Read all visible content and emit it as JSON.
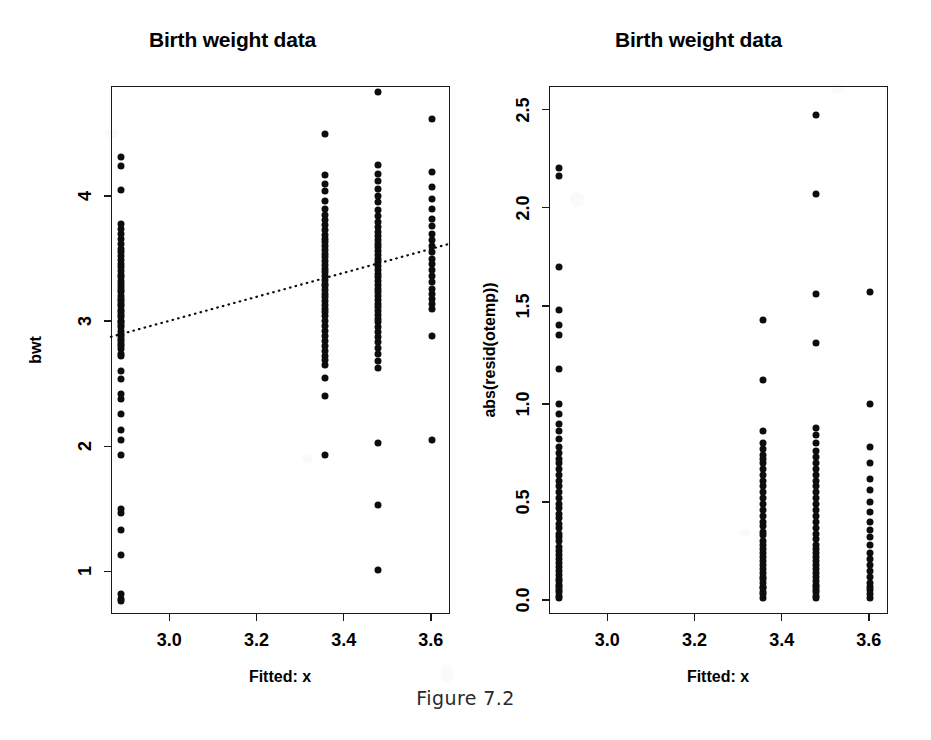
{
  "figure": {
    "caption": "Figure 7.2",
    "background_color": "#ffffff",
    "ink_color": "#0d0d0d"
  },
  "panels": [
    {
      "id": "left",
      "title": "Birth weight data",
      "xlabel": "Fitted: x",
      "ylabel": "bwt",
      "xticks": [
        "3.0",
        "3.2",
        "3.4",
        "3.6"
      ],
      "yticks": [
        "1",
        "2",
        "3",
        "4"
      ]
    },
    {
      "id": "right",
      "title": "Birth weight data",
      "xlabel": "Fitted: x",
      "ylabel": "abs(resid(otemp))",
      "xticks": [
        "3.0",
        "3.2",
        "3.4",
        "3.6"
      ],
      "yticks": [
        "0.0",
        "0.5",
        "1.0",
        "1.5",
        "2.0",
        "2.5"
      ]
    }
  ],
  "chart_data": [
    {
      "type": "scatter",
      "panel": "left",
      "title": "Birth weight data",
      "xlabel": "Fitted: x",
      "ylabel": "bwt",
      "xlim": [
        2.866,
        3.644
      ],
      "ylim": [
        0.66,
        4.88
      ],
      "xticks": [
        3.0,
        3.2,
        3.4,
        3.6
      ],
      "yticks": [
        1,
        2,
        3,
        4
      ],
      "grid": false,
      "legend": false,
      "annotations": [
        {
          "kind": "fitted-line",
          "style": "dotted",
          "x": [
            2.866,
            3.644
          ],
          "y": [
            2.875,
            3.62
          ]
        }
      ],
      "groups": [
        {
          "x": 2.889,
          "y": [
            0.76,
            0.78,
            0.82,
            1.13,
            1.33,
            1.47,
            1.5,
            1.93,
            2.05,
            2.13,
            2.26,
            2.38,
            2.42,
            2.54,
            2.6,
            2.72,
            2.74,
            2.78,
            2.8,
            2.82,
            2.84,
            2.86,
            2.88,
            2.9,
            2.92,
            2.95,
            2.97,
            2.99,
            3.0,
            3.03,
            3.05,
            3.07,
            3.09,
            3.12,
            3.14,
            3.16,
            3.18,
            3.2,
            3.23,
            3.25,
            3.27,
            3.3,
            3.32,
            3.35,
            3.37,
            3.4,
            3.43,
            3.46,
            3.49,
            3.52,
            3.55,
            3.58,
            3.62,
            3.66,
            3.7,
            3.74,
            3.78,
            4.05,
            4.24,
            4.31
          ]
        },
        {
          "x": 3.357,
          "y": [
            2.4,
            2.55,
            2.65,
            2.69,
            2.72,
            2.76,
            2.8,
            2.84,
            2.88,
            2.92,
            2.96,
            3.0,
            3.04,
            3.07,
            3.1,
            3.13,
            3.16,
            3.19,
            3.22,
            3.25,
            3.28,
            3.3,
            3.33,
            3.36,
            3.39,
            3.42,
            3.45,
            3.48,
            3.51,
            3.54,
            3.57,
            3.6,
            3.63,
            3.66,
            3.69,
            3.73,
            3.77,
            3.81,
            3.85,
            3.9,
            3.96,
            4.04,
            4.1,
            4.17,
            4.5,
            1.93
          ]
        },
        {
          "x": 3.478,
          "y": [
            1.01,
            1.53,
            2.03,
            2.63,
            2.68,
            2.74,
            2.79,
            2.83,
            2.87,
            2.91,
            2.95,
            2.99,
            3.02,
            3.05,
            3.08,
            3.11,
            3.14,
            3.17,
            3.2,
            3.23,
            3.26,
            3.29,
            3.32,
            3.35,
            3.38,
            3.41,
            3.44,
            3.47,
            3.5,
            3.53,
            3.56,
            3.59,
            3.62,
            3.65,
            3.68,
            3.71,
            3.75,
            3.79,
            3.84,
            3.89,
            3.95,
            4.0,
            4.06,
            4.12,
            4.18,
            4.25,
            4.83
          ]
        },
        {
          "x": 3.603,
          "y": [
            2.05,
            2.88,
            3.1,
            3.14,
            3.18,
            3.22,
            3.26,
            3.31,
            3.36,
            3.41,
            3.46,
            3.5,
            3.55,
            3.6,
            3.65,
            3.7,
            3.76,
            3.82,
            3.9,
            3.98,
            4.07,
            4.19,
            4.62
          ]
        }
      ]
    },
    {
      "type": "scatter",
      "panel": "right",
      "title": "Birth weight data",
      "xlabel": "Fitted: x",
      "ylabel": "abs(resid(otemp))",
      "xlim": [
        2.866,
        3.644
      ],
      "ylim": [
        -0.07,
        2.62
      ],
      "xticks": [
        3.0,
        3.2,
        3.4,
        3.6
      ],
      "yticks": [
        0.0,
        0.5,
        1.0,
        1.5,
        2.0,
        2.5
      ],
      "grid": false,
      "legend": false,
      "annotations": [],
      "groups": [
        {
          "x": 2.889,
          "y": [
            0.01,
            0.02,
            0.04,
            0.05,
            0.07,
            0.08,
            0.1,
            0.11,
            0.13,
            0.15,
            0.17,
            0.19,
            0.21,
            0.23,
            0.25,
            0.27,
            0.3,
            0.32,
            0.34,
            0.37,
            0.39,
            0.42,
            0.44,
            0.47,
            0.49,
            0.52,
            0.55,
            0.58,
            0.61,
            0.64,
            0.67,
            0.7,
            0.72,
            0.75,
            0.78,
            0.82,
            0.86,
            0.9,
            0.95,
            1.0,
            1.18,
            1.35,
            1.4,
            1.48,
            1.7,
            2.16,
            2.2
          ]
        },
        {
          "x": 3.357,
          "y": [
            0.01,
            0.03,
            0.04,
            0.06,
            0.07,
            0.09,
            0.11,
            0.12,
            0.14,
            0.16,
            0.18,
            0.2,
            0.22,
            0.24,
            0.26,
            0.28,
            0.3,
            0.33,
            0.35,
            0.38,
            0.4,
            0.43,
            0.46,
            0.49,
            0.52,
            0.55,
            0.58,
            0.61,
            0.64,
            0.67,
            0.7,
            0.72,
            0.74,
            0.77,
            0.8,
            0.86,
            1.12,
            1.43
          ]
        },
        {
          "x": 3.478,
          "y": [
            0.01,
            0.02,
            0.04,
            0.05,
            0.07,
            0.08,
            0.1,
            0.12,
            0.14,
            0.16,
            0.18,
            0.2,
            0.22,
            0.24,
            0.26,
            0.28,
            0.31,
            0.34,
            0.37,
            0.4,
            0.43,
            0.46,
            0.49,
            0.52,
            0.55,
            0.58,
            0.61,
            0.64,
            0.67,
            0.7,
            0.73,
            0.76,
            0.8,
            0.84,
            0.88,
            1.31,
            1.56,
            2.07,
            2.47
          ]
        },
        {
          "x": 3.603,
          "y": [
            0.01,
            0.03,
            0.05,
            0.07,
            0.09,
            0.12,
            0.15,
            0.18,
            0.21,
            0.24,
            0.28,
            0.32,
            0.36,
            0.4,
            0.45,
            0.5,
            0.56,
            0.62,
            0.7,
            0.78,
            1.0,
            1.57
          ]
        }
      ]
    }
  ]
}
